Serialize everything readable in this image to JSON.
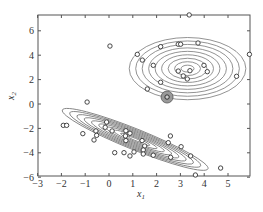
{
  "chart_data": {
    "type": "scatter",
    "title": "",
    "xlabel": "x1",
    "ylabel": "x2",
    "xlim": [
      -3,
      5.9
    ],
    "ylim": [
      -6,
      7.3
    ],
    "xticks": [
      -3,
      -2,
      -1,
      0,
      1,
      2,
      3,
      4,
      5
    ],
    "yticks": [
      -6,
      -4,
      -2,
      0,
      2,
      4,
      6
    ],
    "grid": false,
    "legend": null,
    "marker": "open-circle",
    "colors": {
      "axis": "#555555",
      "contour": "#777777",
      "marker": "#333333",
      "highlight_fill": "#999999"
    },
    "series": [
      {
        "name": "points",
        "points": [
          [
            3.37,
            7.3
          ],
          [
            2.17,
            4.7
          ],
          [
            2.91,
            4.9
          ],
          [
            3.01,
            4.9
          ],
          [
            3.74,
            5.0
          ],
          [
            1.19,
            4.07
          ],
          [
            1.4,
            3.6
          ],
          [
            1.86,
            3.17
          ],
          [
            3.99,
            3.17
          ],
          [
            4.13,
            2.65
          ],
          [
            2.91,
            2.7
          ],
          [
            3.4,
            2.73
          ],
          [
            3.12,
            2.3
          ],
          [
            3.29,
            2.05
          ],
          [
            2.17,
            1.78
          ],
          [
            1.61,
            1.23
          ],
          [
            5.36,
            2.27
          ],
          [
            5.9,
            4.07
          ],
          [
            0.04,
            4.75
          ],
          [
            -0.92,
            0.16
          ],
          [
            -1.92,
            -1.75
          ],
          [
            -1.78,
            -1.75
          ],
          [
            -1.1,
            -2.43
          ],
          [
            -0.55,
            -2.21
          ],
          [
            -0.52,
            -2.57
          ],
          [
            -0.63,
            -2.95
          ],
          [
            -0.1,
            -1.48
          ],
          [
            -0.16,
            -1.91
          ],
          [
            0.13,
            -2.21
          ],
          [
            0.63,
            -3.99
          ],
          [
            0.71,
            -2.19
          ],
          [
            0.88,
            -2.4
          ],
          [
            0.69,
            -2.62
          ],
          [
            0.71,
            -3.0
          ],
          [
            0.24,
            -3.99
          ],
          [
            0.88,
            -4.26
          ],
          [
            1.05,
            -3.93
          ],
          [
            1.39,
            -3.0
          ],
          [
            1.5,
            -3.44
          ],
          [
            1.44,
            -3.77
          ],
          [
            1.44,
            -4.1
          ],
          [
            1.86,
            -4.2
          ],
          [
            2.58,
            -2.62
          ],
          [
            2.49,
            -3.17
          ],
          [
            3.03,
            -3.5
          ],
          [
            2.59,
            -4.37
          ],
          [
            3.43,
            -4.26
          ],
          [
            4.69,
            -5.25
          ],
          [
            3.63,
            -5.82
          ]
        ]
      },
      {
        "name": "highlighted-point",
        "points": [
          [
            2.44,
            0.57
          ]
        ]
      }
    ],
    "contours": [
      {
        "name": "upper-gaussian",
        "center": [
          3.3,
          2.9
        ],
        "rx_max": 2.45,
        "ry_max": 2.55,
        "rotation_deg": 0,
        "levels": 9
      },
      {
        "name": "lower-gaussian",
        "center": [
          1.1,
          -2.9
        ],
        "rx_max": 3.3,
        "ry_max": 0.85,
        "rotation_deg": 22,
        "levels": 10
      }
    ]
  }
}
